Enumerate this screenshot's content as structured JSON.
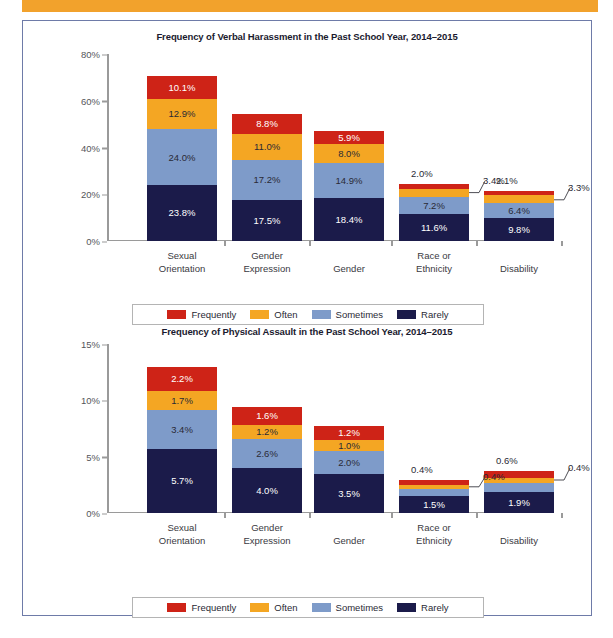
{
  "page": {
    "accent_band_color": "#F2A22C",
    "frame_border_color": "#6E7BA8"
  },
  "palette": {
    "Frequently": "#CE2317",
    "Often": "#F4A623",
    "Sometimes": "#7E9BC9",
    "Rarely": "#1B1B4A"
  },
  "legend": {
    "items": [
      {
        "label": "Frequently",
        "color": "#CE2317"
      },
      {
        "label": "Often",
        "color": "#F4A623"
      },
      {
        "label": "Sometimes",
        "color": "#7E9BC9"
      },
      {
        "label": "Rarely",
        "color": "#1B1B4A"
      }
    ]
  },
  "chart_data": [
    {
      "id": "verbal-harassment",
      "type": "bar",
      "stacked": true,
      "title": "Frequency of Verbal Harassment in the Past School Year, 2014–2015",
      "xlabel": "",
      "ylabel": "",
      "ylim": [
        0,
        80
      ],
      "yticks": [
        0,
        20,
        40,
        60,
        80
      ],
      "ytick_labels": [
        "0%",
        "20%",
        "40%",
        "60%",
        "80%"
      ],
      "grid": false,
      "legend_position": "bottom",
      "categories": [
        "Sexual\nOrientation",
        "Gender\nExpression",
        "Gender",
        "Race or\nEthnicity",
        "Disability"
      ],
      "series": [
        {
          "name": "Rarely",
          "color": "#1B1B4A",
          "values": [
            23.8,
            17.5,
            18.4,
            11.6,
            9.8
          ],
          "labels": [
            "23.8%",
            "17.5%",
            "18.4%",
            "11.6%",
            "9.8%"
          ]
        },
        {
          "name": "Sometimes",
          "color": "#7E9BC9",
          "values": [
            24.0,
            17.2,
            14.9,
            7.2,
            6.4
          ],
          "labels": [
            "24.0%",
            "17.2%",
            "14.9%",
            "7.2%",
            "6.4%"
          ]
        },
        {
          "name": "Often",
          "color": "#F4A623",
          "values": [
            12.9,
            11.0,
            8.0,
            3.4,
            3.3
          ],
          "labels": [
            "12.9%",
            "11.0%",
            "8.0%",
            "3.4%",
            "3.3%"
          ]
        },
        {
          "name": "Frequently",
          "color": "#CE2317",
          "values": [
            10.1,
            8.8,
            5.9,
            2.0,
            2.1
          ],
          "labels": [
            "10.1%",
            "8.8%",
            "5.9%",
            "2.0%",
            "2.1%"
          ]
        }
      ],
      "annotations": [
        {
          "text": "2.0%",
          "kind": "above-bar",
          "category_index": 3,
          "series": "Frequently"
        },
        {
          "text": "3.4%",
          "kind": "callout",
          "category_index": 3,
          "series": "Often"
        },
        {
          "text": "2.1%",
          "kind": "above-bar",
          "category_index": 4,
          "series": "Frequently"
        },
        {
          "text": "3.3%",
          "kind": "callout",
          "category_index": 4,
          "series": "Often"
        }
      ]
    },
    {
      "id": "physical-assault",
      "type": "bar",
      "stacked": true,
      "title": "Frequency of Physical Assault in the Past School Year, 2014–2015",
      "xlabel": "",
      "ylabel": "",
      "ylim": [
        0,
        15
      ],
      "yticks": [
        0,
        5,
        10,
        15
      ],
      "ytick_labels": [
        "0%",
        "5%",
        "10%",
        "15%"
      ],
      "grid": false,
      "legend_position": "bottom",
      "categories": [
        "Sexual\nOrientation",
        "Gender\nExpression",
        "Gender",
        "Race or\nEthnicity",
        "Disability"
      ],
      "series": [
        {
          "name": "Rarely",
          "color": "#1B1B4A",
          "values": [
            5.7,
            4.0,
            3.5,
            1.5,
            1.9
          ],
          "labels": [
            "5.7%",
            "4.0%",
            "3.5%",
            "1.5%",
            "1.9%"
          ]
        },
        {
          "name": "Sometimes",
          "color": "#7E9BC9",
          "values": [
            3.4,
            2.6,
            2.0,
            0.6,
            0.8
          ],
          "labels": [
            "3.4%",
            "2.6%",
            "2.0%",
            "0.6%",
            "0.8%"
          ]
        },
        {
          "name": "Often",
          "color": "#F4A623",
          "values": [
            1.7,
            1.2,
            1.0,
            0.4,
            0.4
          ],
          "labels": [
            "1.7%",
            "1.2%",
            "1.0%",
            "0.4%",
            "0.4%"
          ]
        },
        {
          "name": "Frequently",
          "color": "#CE2317",
          "values": [
            2.2,
            1.6,
            1.2,
            0.4,
            0.6
          ],
          "labels": [
            "2.2%",
            "1.6%",
            "1.2%",
            "0.4%",
            "0.6%"
          ]
        }
      ],
      "annotations": [
        {
          "text": "0.4%",
          "kind": "above-bar",
          "category_index": 3,
          "series": "Frequently"
        },
        {
          "text": "0.4%",
          "kind": "callout",
          "category_index": 3,
          "series": "Often"
        },
        {
          "text": "0.6%",
          "kind": "above-bar",
          "category_index": 4,
          "series": "Frequently"
        },
        {
          "text": "0.4%",
          "kind": "callout",
          "category_index": 4,
          "series": "Often"
        }
      ]
    }
  ]
}
